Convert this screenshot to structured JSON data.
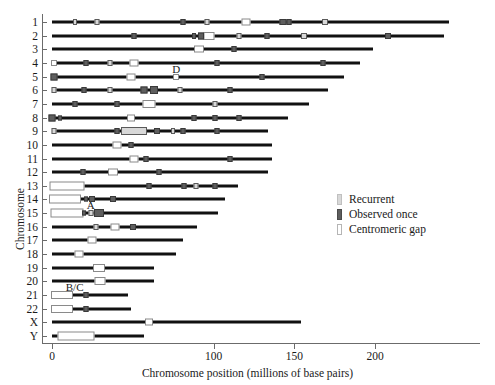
{
  "chart_data": {
    "type": "scatter",
    "title": "",
    "xlabel": "Chromosome position (millions of base pairs)",
    "ylabel": "Chromosome",
    "xlim": [
      0,
      260
    ],
    "xticks": [
      0,
      100,
      150,
      200
    ],
    "xticklabels": [
      "0",
      "100",
      "150",
      "200"
    ],
    "grid": false,
    "legend_position": "center-right",
    "categories": [
      "1",
      "2",
      "3",
      "4",
      "5",
      "6",
      "7",
      "8",
      "9",
      "10",
      "11",
      "12",
      "13",
      "14",
      "15",
      "16",
      "17",
      "18",
      "19",
      "20",
      "21",
      "22",
      "X",
      "Y"
    ],
    "legend": [
      {
        "label": "Recurrent",
        "swatch": "recurrent",
        "color": "#d8d8d8"
      },
      {
        "label": "Observed once",
        "swatch": "once",
        "color": "#5e5e5e"
      },
      {
        "label": "Centromeric gap",
        "swatch": "gap",
        "color": "#ffffff"
      }
    ],
    "annotations": [
      {
        "text": "D",
        "x": 77,
        "chrom": "5"
      },
      {
        "text": "A",
        "x": 24,
        "chrom": "15"
      },
      {
        "text": "B/C",
        "x": 14,
        "chrom": "21"
      }
    ],
    "chromosomes": [
      {
        "name": "1",
        "length": 246,
        "markers": [
          {
            "x": 14,
            "type": "recurrent",
            "w": 4,
            "h": 6
          },
          {
            "x": 28,
            "type": "recurrent",
            "w": 5,
            "h": 6
          },
          {
            "x": 81,
            "type": "once",
            "w": 5,
            "h": 6
          },
          {
            "x": 96,
            "type": "recurrent",
            "w": 5,
            "h": 6
          },
          {
            "x": 120,
            "type": "gap",
            "w": 9,
            "h": 7
          },
          {
            "x": 143,
            "type": "once",
            "w": 7,
            "h": 6
          },
          {
            "x": 147,
            "type": "once",
            "w": 5,
            "h": 6
          },
          {
            "x": 169,
            "type": "recurrent",
            "w": 6,
            "h": 6
          }
        ]
      },
      {
        "name": "2",
        "length": 243,
        "markers": [
          {
            "x": 51,
            "type": "once",
            "w": 5,
            "h": 6
          },
          {
            "x": 88,
            "type": "once",
            "w": 4,
            "h": 6
          },
          {
            "x": 92,
            "type": "once",
            "w": 6,
            "h": 7
          },
          {
            "x": 97,
            "type": "gap",
            "w": 11,
            "h": 8
          },
          {
            "x": 116,
            "type": "recurrent",
            "w": 5,
            "h": 6
          },
          {
            "x": 133,
            "type": "once",
            "w": 5,
            "h": 6
          },
          {
            "x": 156,
            "type": "recurrent",
            "w": 6,
            "h": 6
          },
          {
            "x": 208,
            "type": "once",
            "w": 6,
            "h": 6
          }
        ]
      },
      {
        "name": "3",
        "length": 199,
        "markers": [
          {
            "x": 91,
            "type": "gap",
            "w": 10,
            "h": 7
          },
          {
            "x": 113,
            "type": "once",
            "w": 5,
            "h": 6
          }
        ]
      },
      {
        "name": "4",
        "length": 191,
        "markers": [
          {
            "x": 1,
            "type": "gap",
            "w": 6,
            "h": 6
          },
          {
            "x": 21,
            "type": "once",
            "w": 5,
            "h": 6
          },
          {
            "x": 36,
            "type": "recurrent",
            "w": 5,
            "h": 6
          },
          {
            "x": 51,
            "type": "gap",
            "w": 9,
            "h": 7
          },
          {
            "x": 102,
            "type": "once",
            "w": 5,
            "h": 6
          },
          {
            "x": 168,
            "type": "once",
            "w": 5,
            "h": 6
          }
        ]
      },
      {
        "name": "5",
        "length": 181,
        "markers": [
          {
            "x": 1,
            "type": "once",
            "w": 7,
            "h": 7
          },
          {
            "x": 49,
            "type": "gap",
            "w": 9,
            "h": 7
          },
          {
            "x": 77,
            "type": "gap",
            "w": 6,
            "h": 6
          },
          {
            "x": 130,
            "type": "once",
            "w": 5,
            "h": 6
          }
        ]
      },
      {
        "name": "6",
        "length": 171,
        "markers": [
          {
            "x": 1,
            "type": "recurrent",
            "w": 5,
            "h": 6
          },
          {
            "x": 20,
            "type": "once",
            "w": 5,
            "h": 6
          },
          {
            "x": 36,
            "type": "recurrent",
            "w": 5,
            "h": 6
          },
          {
            "x": 57,
            "type": "once",
            "w": 7,
            "h": 7
          },
          {
            "x": 63,
            "type": "once",
            "w": 8,
            "h": 8
          },
          {
            "x": 79,
            "type": "recurrent",
            "w": 5,
            "h": 6
          },
          {
            "x": 110,
            "type": "once",
            "w": 5,
            "h": 6
          }
        ]
      },
      {
        "name": "7",
        "length": 159,
        "markers": [
          {
            "x": 14,
            "type": "once",
            "w": 5,
            "h": 6
          },
          {
            "x": 40,
            "type": "once",
            "w": 5,
            "h": 6
          },
          {
            "x": 60,
            "type": "gap",
            "w": 13,
            "h": 8
          },
          {
            "x": 101,
            "type": "recurrent",
            "w": 5,
            "h": 6
          }
        ]
      },
      {
        "name": "8",
        "length": 146,
        "markers": [
          {
            "x": 0,
            "type": "once",
            "w": 7,
            "h": 7
          },
          {
            "x": 5,
            "type": "once",
            "w": 4,
            "h": 5
          },
          {
            "x": 49,
            "type": "gap",
            "w": 8,
            "h": 7
          },
          {
            "x": 88,
            "type": "once",
            "w": 5,
            "h": 6
          },
          {
            "x": 101,
            "type": "once",
            "w": 5,
            "h": 6
          },
          {
            "x": 116,
            "type": "once",
            "w": 5,
            "h": 6
          }
        ]
      },
      {
        "name": "9",
        "length": 134,
        "markers": [
          {
            "x": 1,
            "type": "recurrent",
            "w": 5,
            "h": 6
          },
          {
            "x": 40,
            "type": "once",
            "w": 5,
            "h": 6
          },
          {
            "x": 51,
            "type": "recurrent",
            "w": 26,
            "h": 8
          },
          {
            "x": 65,
            "type": "once",
            "w": 6,
            "h": 6
          },
          {
            "x": 75,
            "type": "recurrent",
            "w": 4,
            "h": 6
          },
          {
            "x": 81,
            "type": "once",
            "w": 5,
            "h": 6
          },
          {
            "x": 102,
            "type": "once",
            "w": 5,
            "h": 6
          }
        ]
      },
      {
        "name": "10",
        "length": 136,
        "markers": [
          {
            "x": 40,
            "type": "gap",
            "w": 9,
            "h": 7
          },
          {
            "x": 49,
            "type": "once",
            "w": 5,
            "h": 6
          }
        ]
      },
      {
        "name": "11",
        "length": 136,
        "markers": [
          {
            "x": 51,
            "type": "gap",
            "w": 9,
            "h": 7
          },
          {
            "x": 58,
            "type": "once",
            "w": 5,
            "h": 6
          },
          {
            "x": 110,
            "type": "once",
            "w": 5,
            "h": 6
          }
        ]
      },
      {
        "name": "12",
        "length": 134,
        "markers": [
          {
            "x": 19,
            "type": "once",
            "w": 5,
            "h": 6
          },
          {
            "x": 38,
            "type": "gap",
            "w": 10,
            "h": 7
          },
          {
            "x": 66,
            "type": "once",
            "w": 5,
            "h": 6
          }
        ]
      },
      {
        "name": "13",
        "length": 115,
        "start": 0,
        "markers": [
          {
            "x": 9,
            "type": "gap",
            "w": 35,
            "h": 9
          },
          {
            "x": 60,
            "type": "once",
            "w": 5,
            "h": 6
          },
          {
            "x": 82,
            "type": "once",
            "w": 5,
            "h": 6
          },
          {
            "x": 89,
            "type": "recurrent",
            "w": 5,
            "h": 6
          },
          {
            "x": 101,
            "type": "once",
            "w": 5,
            "h": 6
          }
        ]
      },
      {
        "name": "14",
        "length": 107,
        "start": 0,
        "markers": [
          {
            "x": 8,
            "type": "gap",
            "w": 32,
            "h": 9
          },
          {
            "x": 21,
            "type": "once",
            "w": 4,
            "h": 5
          },
          {
            "x": 25,
            "type": "once",
            "w": 6,
            "h": 6
          },
          {
            "x": 38,
            "type": "once",
            "w": 6,
            "h": 6
          }
        ]
      },
      {
        "name": "15",
        "length": 103,
        "start": 0,
        "markers": [
          {
            "x": 9,
            "type": "gap",
            "w": 33,
            "h": 9
          },
          {
            "x": 20,
            "type": "once",
            "w": 4,
            "h": 5
          },
          {
            "x": 24,
            "type": "recurrent",
            "w": 5,
            "h": 6
          },
          {
            "x": 29,
            "type": "once",
            "w": 10,
            "h": 8
          }
        ]
      },
      {
        "name": "16",
        "length": 90,
        "markers": [
          {
            "x": 27,
            "type": "recurrent",
            "w": 5,
            "h": 6
          },
          {
            "x": 39,
            "type": "gap",
            "w": 9,
            "h": 7
          },
          {
            "x": 50,
            "type": "once",
            "w": 6,
            "h": 6
          }
        ]
      },
      {
        "name": "17",
        "length": 81,
        "markers": [
          {
            "x": 25,
            "type": "gap",
            "w": 9,
            "h": 7
          }
        ]
      },
      {
        "name": "18",
        "length": 77,
        "markers": [
          {
            "x": 17,
            "type": "gap",
            "w": 9,
            "h": 7
          }
        ]
      },
      {
        "name": "19",
        "length": 63,
        "markers": [
          {
            "x": 29,
            "type": "gap",
            "w": 12,
            "h": 8
          }
        ]
      },
      {
        "name": "20",
        "length": 63,
        "markers": [
          {
            "x": 30,
            "type": "gap",
            "w": 11,
            "h": 8
          }
        ]
      },
      {
        "name": "21",
        "length": 47,
        "start": 0,
        "markers": [
          {
            "x": 6,
            "type": "gap",
            "w": 22,
            "h": 8
          },
          {
            "x": 21,
            "type": "once",
            "w": 5,
            "h": 6
          }
        ]
      },
      {
        "name": "22",
        "length": 49,
        "start": 0,
        "markers": [
          {
            "x": 6,
            "type": "gap",
            "w": 22,
            "h": 8
          },
          {
            "x": 21,
            "type": "once",
            "w": 5,
            "h": 6
          }
        ]
      },
      {
        "name": "X",
        "length": 154,
        "markers": [
          {
            "x": 60,
            "type": "gap",
            "w": 8,
            "h": 7
          }
        ]
      },
      {
        "name": "Y",
        "length": 57,
        "markers": [
          {
            "x": 15,
            "type": "gap",
            "w": 37,
            "h": 9
          }
        ]
      }
    ]
  }
}
